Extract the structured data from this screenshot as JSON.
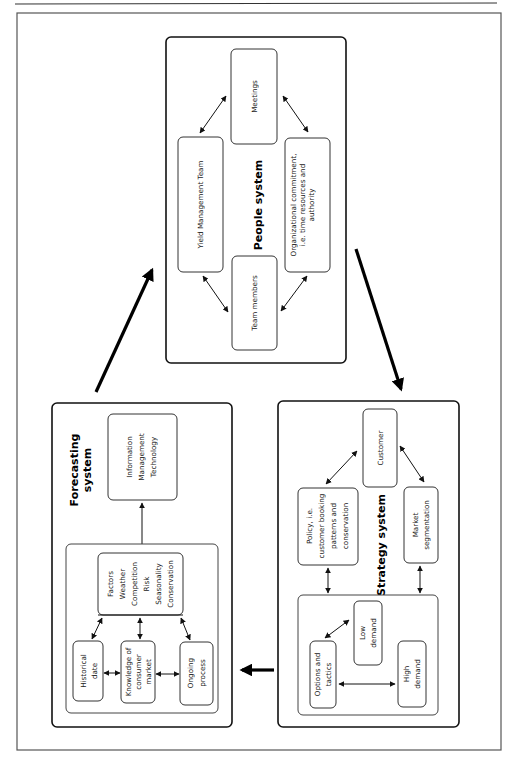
{
  "diagram": {
    "people_system": {
      "title": "People system",
      "nodes": {
        "meetings": "Meetings",
        "yield_team": "Yield Management Team",
        "org_commitment": [
          "Organizational commitment,",
          "i.e. time resources and",
          "authority"
        ],
        "team_members": "Team members"
      }
    },
    "forecasting_system": {
      "title": [
        "Forecasting",
        "system"
      ],
      "nodes": {
        "info_mgmt": [
          "Information",
          "Management",
          "Technology"
        ],
        "factors": [
          "Factors",
          "Weather",
          "Competition",
          "Risk",
          "Seasonality",
          "Conservation"
        ],
        "historical": [
          "Historical",
          "date"
        ],
        "knowledge": [
          "Knowledge of",
          "consumer",
          "market"
        ],
        "ongoing": [
          "Ongoing",
          "process"
        ]
      }
    },
    "strategy_system": {
      "title": "Strategy system",
      "nodes": {
        "customer": "Customer",
        "policy": [
          "Policy, i.e.",
          "customer booking",
          "patterns and",
          "conservation"
        ],
        "market_seg": [
          "Market",
          "segmentation"
        ],
        "options": [
          "Options and",
          "tactics"
        ],
        "low_demand": [
          "Low",
          "demand"
        ],
        "high_demand": [
          "High",
          "demand"
        ]
      }
    },
    "flow": [
      "Forecasting system",
      "People system",
      "Strategy system",
      "Forecasting system"
    ]
  }
}
